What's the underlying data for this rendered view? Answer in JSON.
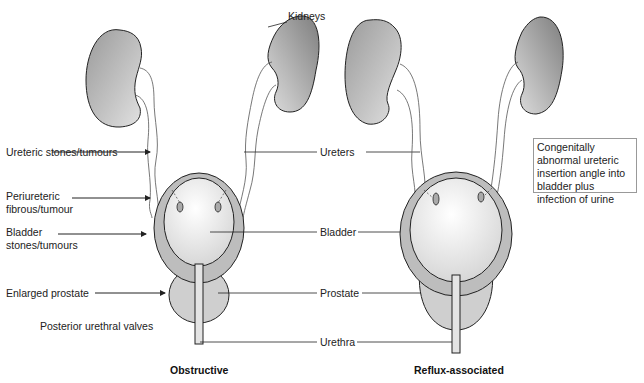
{
  "diagram": {
    "panels": [
      {
        "title": "Obstructive",
        "causes": [
          {
            "label": "Ureteric stones/tumours"
          },
          {
            "label": "Periureteric fibrous/tumour"
          },
          {
            "label": "Bladder stones/tumours"
          },
          {
            "label": "Enlarged prostate"
          },
          {
            "label": "Posterior urethral valves"
          }
        ]
      },
      {
        "title": "Reflux-associated",
        "note": "Congenitally abnormal ureteric insertion angle into bladder plus infection of urine"
      }
    ],
    "anatomy_labels": {
      "kidneys": "Kidneys",
      "ureters": "Ureters",
      "bladder": "Bladder",
      "prostate": "Prostate",
      "urethra": "Urethra"
    },
    "colors": {
      "organ_dark": "#7a7a7a",
      "organ_light": "#e8e8e8",
      "bladder_wall": "#bdbdbd",
      "outline": "#222222"
    }
  }
}
